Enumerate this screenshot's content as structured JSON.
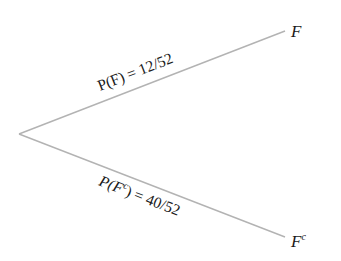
{
  "diagram": {
    "type": "probability-tree",
    "line_color": "#b3b3b3",
    "text_color": "#1a1a1a",
    "root": {
      "x": 19,
      "y": 134
    },
    "branches": [
      {
        "id": "F",
        "end": {
          "x": 285,
          "y": 31
        },
        "node_label": "F",
        "node_sup": "",
        "edge_label_prefix": "P(F",
        "edge_label_sup": "",
        "edge_label_suffix": ") = 12/52",
        "edge_label": "P(F) = 12/52"
      },
      {
        "id": "F-complement",
        "end": {
          "x": 285,
          "y": 237
        },
        "node_label": "F",
        "node_sup": "c",
        "edge_label_prefix": "P(F",
        "edge_label_sup": "c",
        "edge_label_suffix": ") = 40/52",
        "edge_label": "P(F^c) = 40/52"
      }
    ]
  }
}
